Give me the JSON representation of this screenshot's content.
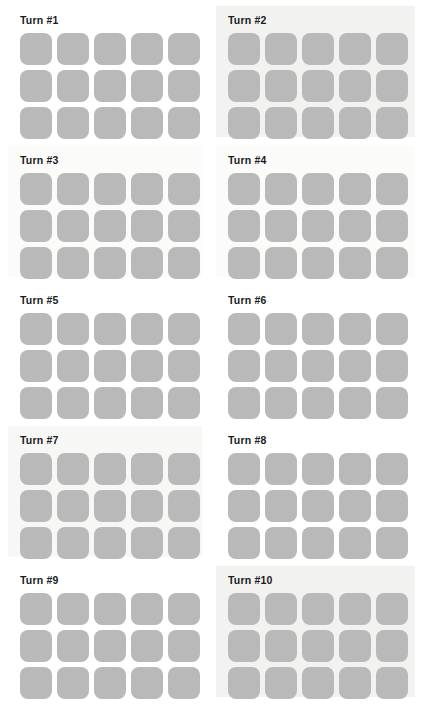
{
  "page": {
    "background_color": "#ffffff",
    "layout": {
      "columns": 2,
      "rows": 5,
      "panel_count": 10
    }
  },
  "tile": {
    "fill_color": "#b9b9b9",
    "rows_per_panel": 3,
    "cols_per_panel": 5,
    "count_per_panel": 15,
    "shape": "rounded-square"
  },
  "panel_tints": {
    "none": "#ffffff",
    "faint": "#fbfbfa",
    "light": "#f7f7f6",
    "strong": "#f2f2f1"
  },
  "panels": [
    {
      "label": "Turn #1",
      "tint": "none",
      "tiles": 15
    },
    {
      "label": "Turn #2",
      "tint": "strong",
      "tiles": 15
    },
    {
      "label": "Turn #3",
      "tint": "faint",
      "tiles": 15
    },
    {
      "label": "Turn #4",
      "tint": "faint",
      "tiles": 15
    },
    {
      "label": "Turn #5",
      "tint": "none",
      "tiles": 15
    },
    {
      "label": "Turn #6",
      "tint": "none",
      "tiles": 15
    },
    {
      "label": "Turn #7",
      "tint": "light",
      "tiles": 15
    },
    {
      "label": "Turn #8",
      "tint": "none",
      "tiles": 15
    },
    {
      "label": "Turn #9",
      "tint": "none",
      "tiles": 15
    },
    {
      "label": "Turn #10",
      "tint": "strong",
      "tiles": 15
    }
  ]
}
